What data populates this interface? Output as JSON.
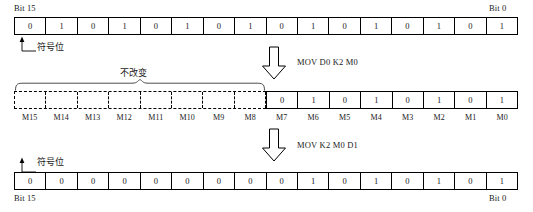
{
  "diagram": {
    "title_top_left": "Bit 15",
    "title_top_right": "Bit 0",
    "title_bottom_left": "Bit 15",
    "title_bottom_right": "Bit 0",
    "sign_bit_label_top": "符号位",
    "sign_bit_label_bottom": "符号位",
    "unchanged_label": "不改变",
    "instruction_1": "MOV D0 K2 M0",
    "instruction_2": "MOV K2 M0 D1",
    "arrow_down_icon_1": "block-arrow-down-icon",
    "arrow_down_icon_2": "block-arrow-down-icon",
    "sign_bit_arrow_icon": "arrow-up-callout-icon",
    "brace_icon": "curly-brace-icon"
  },
  "rows": {
    "source_register": {
      "name": "D0",
      "bits": [
        "0",
        "1",
        "0",
        "1",
        "0",
        "1",
        "0",
        "1",
        "0",
        "1",
        "0",
        "1",
        "0",
        "1",
        "0",
        "1"
      ]
    },
    "bit_array": {
      "name": "M",
      "upper_bits": [
        "",
        "",
        "",
        "",
        "",
        "",
        "",
        ""
      ],
      "lower_bits": [
        "0",
        "1",
        "0",
        "1",
        "0",
        "1",
        "0",
        "1"
      ],
      "labels": [
        "M15",
        "M14",
        "M13",
        "M12",
        "M11",
        "M10",
        "M9",
        "M8",
        "M7",
        "M6",
        "M5",
        "M4",
        "M3",
        "M2",
        "M1",
        "M0"
      ]
    },
    "destination_register": {
      "name": "D1",
      "bits": [
        "0",
        "0",
        "0",
        "0",
        "0",
        "0",
        "0",
        "0",
        "0",
        "1",
        "0",
        "1",
        "0",
        "1",
        "0",
        "1"
      ]
    }
  },
  "colors": {
    "line": "#000000",
    "background": "#ffffff",
    "text": "#1a1a1a"
  }
}
